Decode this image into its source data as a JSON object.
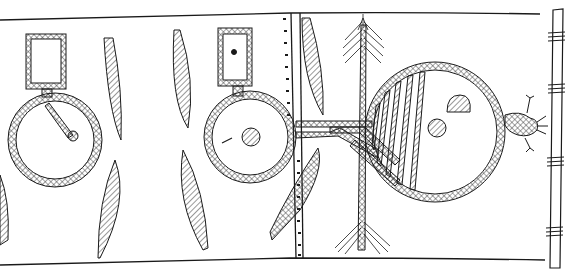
{
  "illustration": {
    "kind": "hand-drawn line drawing",
    "subject": "painted hide panel mounted on a wooden pole",
    "colors": {
      "ink": "#1a1a1a",
      "paper": "#ffffff",
      "hatch": "#555555"
    },
    "elements": [
      {
        "name": "left-circle-with-box",
        "description": "hatched ring with rectangular box on top and a stick to center dot"
      },
      {
        "name": "middle-circle-with-box",
        "description": "hatched ring with small rectangular box containing a dot, center solid dot"
      },
      {
        "name": "right-large-circle",
        "description": "large hatched ring, left part striped, containing a half-dome and a dot"
      },
      {
        "name": "paddle-shapes",
        "description": "hatched leaf/paddle shapes arranged in pairs"
      },
      {
        "name": "arrow",
        "description": "vertical feathered arrow crossing the horizontal band"
      },
      {
        "name": "connector-band",
        "description": "double hatched bands connecting middle circle to right circle"
      },
      {
        "name": "frog-figure",
        "description": "small hatched animal figure attached to right circle"
      },
      {
        "name": "pole",
        "description": "vertical wooden pole with lashings at right edge"
      },
      {
        "name": "seam-stitches",
        "description": "dotted stitch line along hide seam"
      }
    ]
  }
}
